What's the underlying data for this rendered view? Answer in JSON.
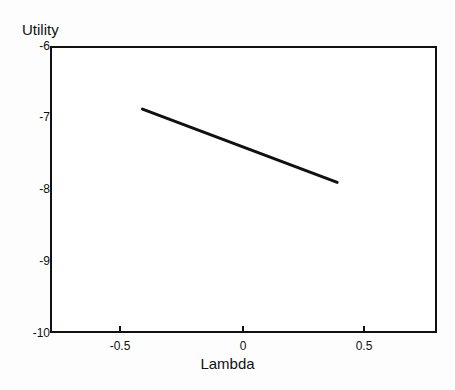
{
  "chart_data": {
    "type": "line",
    "title": "",
    "subtitle": "",
    "xlabel": "Lambda",
    "ylabel": "Utility",
    "xlim": [
      -0.78,
      0.81
    ],
    "ylim": [
      -10,
      -6
    ],
    "grid": false,
    "legend": null,
    "xticks": [
      -0.5,
      0,
      0.5
    ],
    "xticklabels": [
      "-0.5",
      "0",
      "0.5"
    ],
    "yticks": [
      -6,
      -7,
      -8,
      -9,
      -10
    ],
    "yticklabels": [
      "-6",
      "-7",
      "-8",
      "-9",
      "-10"
    ],
    "series": [
      {
        "name": "Utility vs Lambda",
        "color": "#111111",
        "linewidth": 3,
        "x": [
          -0.4,
          0.4
        ],
        "values": [
          -6.88,
          -7.9
        ]
      }
    ],
    "annotations": []
  },
  "axes": {
    "y_axis_title": "Utility",
    "x_axis_title": "Lambda",
    "y_tick_labels": [
      "-6",
      "-7",
      "-8",
      "-9",
      "-10"
    ],
    "x_tick_labels": [
      "-0.5",
      "0",
      "0.5"
    ]
  }
}
